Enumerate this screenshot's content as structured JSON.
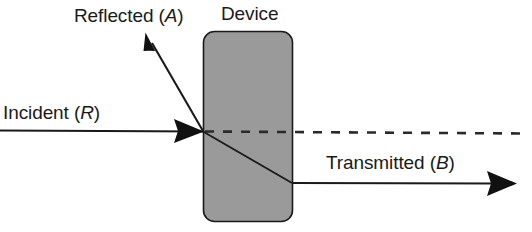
{
  "figure": {
    "kind": "optics-ray-diagram",
    "background_color": "#ffffff",
    "ink_color": "#1a1a1a",
    "device": {
      "label": "Device",
      "fill_color": "#9a9a9a",
      "stroke_color": "#1a1a1a",
      "shape": "rounded-rectangle"
    },
    "labels": {
      "reflected_prefix": "Reflected (",
      "reflected_symbol": "A",
      "reflected_suffix": ")",
      "incident_prefix": "Incident (",
      "incident_symbol": "R",
      "incident_suffix": ")",
      "transmitted_prefix": "Transmitted (",
      "transmitted_symbol": "B",
      "transmitted_suffix": ")",
      "device": "Device"
    },
    "rays": {
      "incident": {
        "name": "Incident (R)",
        "symbol": "R",
        "direction": "left-to-right horizontal",
        "style": "solid-with-arrowhead"
      },
      "reflected": {
        "name": "Reflected (A)",
        "symbol": "A",
        "direction": "up-and-left from interface",
        "style": "solid-with-arrowhead"
      },
      "transmitted": {
        "name": "Transmitted (B)",
        "symbol": "B",
        "direction": "refracted down through device then horizontal right",
        "style": "solid-with-arrowhead"
      },
      "reference_axis": {
        "name": "optical axis",
        "style": "dashed"
      }
    }
  }
}
